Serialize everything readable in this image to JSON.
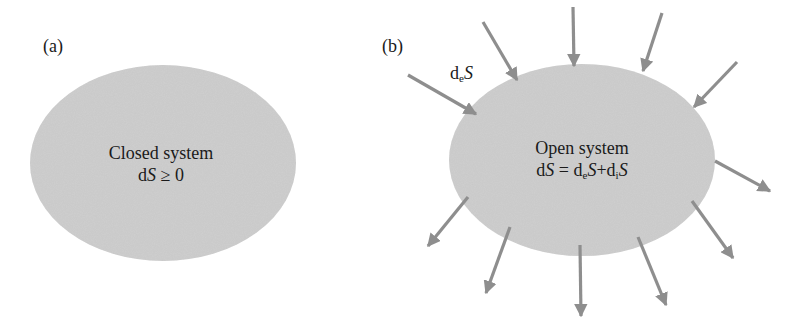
{
  "colors": {
    "ellipse_fill": "#cfcfcf",
    "arrow": "#8e8e8e",
    "text": "#1a1a1a"
  },
  "panel_a": {
    "label": "(a)",
    "title": "Closed system",
    "equation": {
      "d": "d",
      "S": "S",
      "rel": " ≥ 0"
    }
  },
  "panel_b": {
    "label": "(b)",
    "flux_label": {
      "d": "d",
      "sub": "e",
      "S": "S"
    },
    "title": "Open system",
    "equation": {
      "lhs_d": "d",
      "lhs_S": "S",
      "eq": " = ",
      "t1_d": "d",
      "t1_sub": "e",
      "t1_S": "S",
      "plus": "+",
      "t2_d": "d",
      "t2_sub": "i",
      "t2_S": "S"
    },
    "inward_arrows": 5,
    "outward_arrows": 6
  }
}
